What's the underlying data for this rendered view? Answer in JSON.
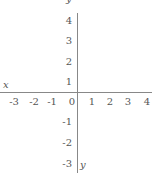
{
  "diagram": {
    "type": "coordinate-axes",
    "x_axis": {
      "label": "x",
      "ticks": [
        "-3",
        "-2",
        "-1",
        "0",
        "1",
        "2",
        "3",
        "4"
      ]
    },
    "y_axis": {
      "label": "y",
      "ticks_positive": [
        "4",
        "3",
        "2",
        "1"
      ],
      "ticks_negative": [
        "-1",
        "-2",
        "-3"
      ]
    },
    "top_label": "y"
  },
  "colors": {
    "axis": "#888888",
    "text": "#555555",
    "background": "#ffffff"
  }
}
